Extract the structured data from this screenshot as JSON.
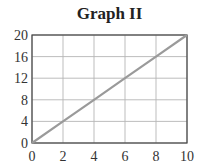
{
  "chart_data": {
    "type": "line",
    "title": "Graph II",
    "xlabel": "",
    "ylabel": "",
    "x": [
      0,
      2,
      4,
      6,
      8,
      10
    ],
    "series": [
      {
        "name": "line",
        "values": [
          0,
          4,
          8,
          12,
          16,
          20
        ],
        "color": "#9a9a9a"
      }
    ],
    "xlim": [
      0,
      10
    ],
    "ylim": [
      0,
      20
    ],
    "xticks": [
      "0",
      "2",
      "4",
      "6",
      "8",
      "10"
    ],
    "yticks": [
      "0",
      "4",
      "8",
      "12",
      "16",
      "20"
    ],
    "grid": true,
    "legend": null
  }
}
